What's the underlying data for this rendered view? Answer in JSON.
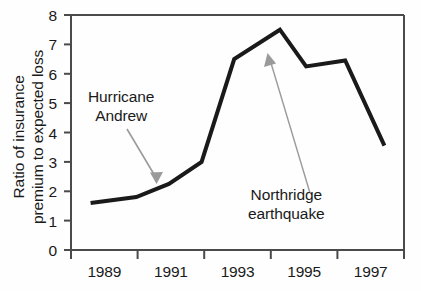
{
  "chart_data": {
    "type": "line",
    "title": "",
    "xlabel": "",
    "ylabel_lines": [
      "Ratio of insurance",
      "premium to expected loss"
    ],
    "ylabel": "Ratio of insurance premium to expected loss",
    "xlim": [
      1988.0,
      1998.2
    ],
    "ylim": [
      0,
      8
    ],
    "grid": false,
    "legend": null,
    "y_ticks": [
      0,
      1,
      2,
      3,
      4,
      5,
      6,
      7,
      8
    ],
    "y_tick_labels": [
      "0",
      "1",
      "2",
      "3",
      "4",
      "5",
      "6",
      "7",
      "8"
    ],
    "x_ticks": [
      1988,
      1990,
      1992,
      1994,
      1996,
      1998
    ],
    "x_tick_labels_shown": [
      "1989",
      "1991",
      "1993",
      "1995",
      "1997"
    ],
    "x_label_positions": [
      1989,
      1991,
      1993,
      1995,
      1997
    ],
    "series": [
      {
        "name": "Ratio of insurance premium to expected loss",
        "color": "#1a1a1a",
        "x": [
          1988.6,
          1990.0,
          1991.0,
          1992.0,
          1993.0,
          1994.4,
          1995.2,
          1996.4,
          1997.6
        ],
        "values": [
          1.6,
          1.8,
          2.25,
          3.0,
          6.5,
          7.5,
          6.25,
          6.45,
          3.55
        ]
      }
    ],
    "annotations": [
      {
        "id": "hurricane-andrew",
        "text_lines": [
          "Hurricane",
          "Andrew"
        ],
        "text": "Hurricane Andrew",
        "arrow_from": [
          1990.25,
          4.1
        ],
        "arrow_to": [
          1991.2,
          2.45
        ],
        "color": "#8a8a8a"
      },
      {
        "id": "northridge-earthquake",
        "text_lines": [
          "Northridge",
          "earthquake"
        ],
        "text": "Northridge earthquake",
        "arrow_from": [
          1994.95,
          1.95
        ],
        "arrow_to": [
          1993.85,
          6.7
        ],
        "color": "#8a8a8a"
      }
    ],
    "axis_color": "#4a4a4a",
    "line_color": "#1a1a1a",
    "line_width_px": 4
  }
}
